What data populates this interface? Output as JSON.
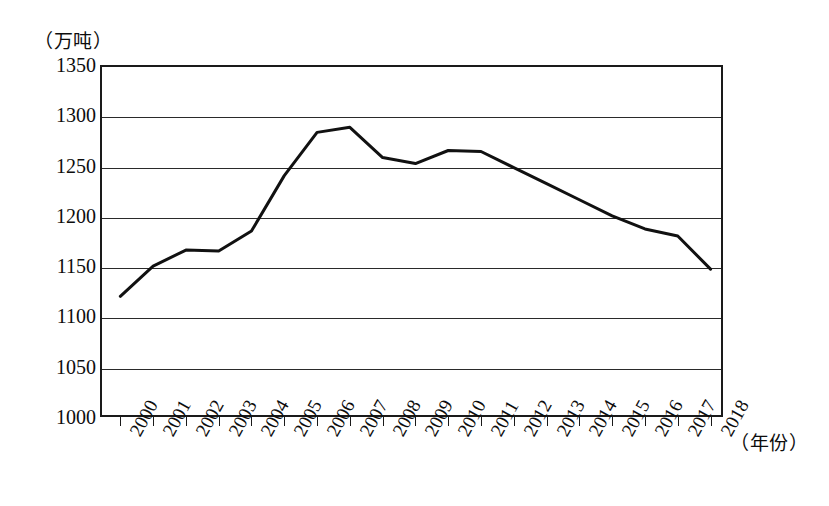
{
  "chart_data": {
    "type": "line",
    "title": "",
    "xlabel": "（年份）",
    "ylabel": "（万吨）",
    "x": [
      2000,
      2001,
      2002,
      2003,
      2004,
      2005,
      2006,
      2007,
      2008,
      2009,
      2010,
      2011,
      2012,
      2013,
      2014,
      2015,
      2016,
      2017,
      2018
    ],
    "categories": [
      "2000",
      "2001",
      "2002",
      "2003",
      "2004",
      "2005",
      "2006",
      "2007",
      "2008",
      "2009",
      "2010",
      "2011",
      "2012",
      "2013",
      "2014",
      "2015",
      "2016",
      "2017",
      "2018"
    ],
    "values": [
      1120,
      1150,
      1166,
      1165,
      1185,
      1240,
      1283,
      1288,
      1258,
      1252,
      1265,
      1264,
      1248,
      1232,
      1216,
      1200,
      1187,
      1180,
      1147
    ],
    "series": [
      {
        "name": "产量",
        "values": [
          1120,
          1150,
          1166,
          1165,
          1185,
          1240,
          1283,
          1288,
          1258,
          1252,
          1265,
          1264,
          1248,
          1232,
          1216,
          1200,
          1187,
          1180,
          1147
        ]
      }
    ],
    "ylim": [
      1000,
      1350
    ],
    "yticks": [
      1000,
      1050,
      1100,
      1150,
      1200,
      1250,
      1300,
      1350
    ],
    "ytick_labels": [
      "1000",
      "1050",
      "1100",
      "1150",
      "1200",
      "1250",
      "1300",
      "1350"
    ],
    "grid": true,
    "grid_axis": "y",
    "legend": false,
    "legend_position": "none",
    "line_color": "#111111",
    "line_width": 3,
    "markers": false,
    "background_color": "#ffffff",
    "frame_color": "#1a1a1a"
  },
  "axes": {
    "y_unit": "（万吨）",
    "x_unit": "（年份）"
  }
}
